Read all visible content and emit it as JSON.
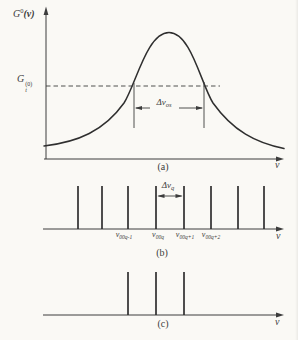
{
  "figure": {
    "background": "#faf9f5",
    "ink": "#3c3c3c",
    "line_ink": "#2f2f2f",
    "panels": {
      "a": {
        "caption": "(a)",
        "x_axis_label": "ν",
        "y_axis_label": {
          "base": "G",
          "sup": "0",
          "arg": "(ν)"
        },
        "threshold_label": {
          "base": "G",
          "sup": "(0)",
          "sub": "t"
        },
        "bandwidth_label": {
          "base": "Δν",
          "sub": "os"
        }
      },
      "b": {
        "caption": "(b)",
        "x_axis_label": "ν",
        "spacing_label": {
          "base": "Δν",
          "sub": "q"
        },
        "mode_labels": [
          {
            "base": "ν",
            "sub": "00q-1"
          },
          {
            "base": "ν",
            "sub": "00q"
          },
          {
            "base": "ν",
            "sub": "00q+1"
          },
          {
            "base": "ν",
            "sub": "00q+2"
          }
        ],
        "mode_line_x": [
          78,
          102,
          128,
          156,
          184,
          211,
          238,
          264
        ]
      },
      "c": {
        "caption": "(c)",
        "x_axis_label": "ν",
        "mode_line_x": [
          128,
          156,
          184
        ]
      }
    }
  }
}
